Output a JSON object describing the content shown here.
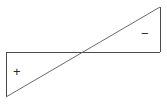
{
  "figure": {
    "background_color": "#ffffff",
    "stroke_color": "#4a4a4a",
    "stroke_width": 1,
    "canvas": {
      "width": 167,
      "height": 105
    }
  },
  "labels": {
    "positive_sign": "+",
    "negative_sign": "−"
  },
  "regions": [
    {
      "name": "lower-left-triangle",
      "sign": "+",
      "sign_position": {
        "x": 19,
        "y": 72
      },
      "vertices": [
        [
          6,
          52
        ],
        [
          6,
          97
        ],
        [
          83,
          52
        ]
      ]
    },
    {
      "name": "upper-right-triangle",
      "sign": "−",
      "sign_position": {
        "x": 147,
        "y": 34
      },
      "vertices": [
        [
          83,
          52
        ],
        [
          160,
          7
        ],
        [
          160,
          52
        ]
      ]
    }
  ],
  "geometry": {
    "horizontal_line": {
      "x1": 6,
      "y1": 52,
      "x2": 160,
      "y2": 52
    },
    "left_vertical_line": {
      "x1": 6,
      "y1": 52,
      "x2": 6,
      "y2": 97
    },
    "right_vertical_line": {
      "x1": 160,
      "y1": 7,
      "x2": 160,
      "y2": 52
    },
    "diagonal_line": {
      "x1": 6,
      "y1": 97,
      "x2": 160,
      "y2": 7
    },
    "crossing_point": {
      "x": 83,
      "y": 52
    }
  }
}
